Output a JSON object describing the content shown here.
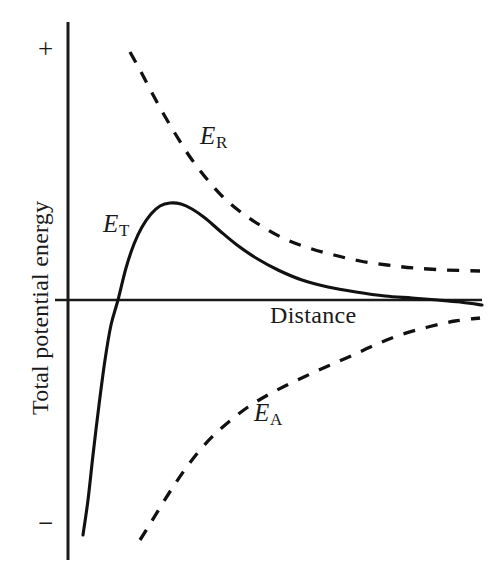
{
  "figure": {
    "background_color": "#ffffff",
    "ink_color": "#1a1a1a",
    "width": 500,
    "height": 573
  },
  "axes": {
    "y_axis_label": "Total potential energy",
    "x_axis_label": "Distance",
    "y_tick_positive": "+",
    "y_tick_negative": "−",
    "y_axis_x_px": 68,
    "zero_line_y_px": 300
  },
  "labels": {
    "e_total_symbol": "E",
    "e_total_subscript": "T",
    "e_repulsive_symbol": "E",
    "e_repulsive_subscript": "R",
    "e_attractive_symbol": "E",
    "e_attractive_subscript": "A"
  },
  "chart_data": {
    "type": "line",
    "title": "",
    "xlabel": "Distance",
    "ylabel": "Total potential energy",
    "xlim": [
      0,
      100
    ],
    "ylim": [
      -100,
      100
    ],
    "grid": false,
    "legend": "inline-annotations",
    "axis_tick_labels": {
      "y": [
        "+",
        "−"
      ],
      "x": []
    },
    "annotations": [
      {
        "text": "E_R",
        "x_px": 210,
        "y_px": 138,
        "series": "repulsive"
      },
      {
        "text": "E_T",
        "x_px": 113,
        "y_px": 223,
        "series": "total"
      },
      {
        "text": "E_A",
        "x_px": 264,
        "y_px": 412,
        "series": "attractive"
      },
      {
        "text": "Distance",
        "x_px": 315,
        "y_px": 315,
        "series": "axis"
      }
    ],
    "series": [
      {
        "name": "E_T",
        "label": "Total potential energy curve",
        "style": "solid",
        "description": "Sum of repulsive and attractive energies: steep negative primary minimum at very short distance, rises steeply through zero, peaks at an energy barrier, then decays and crosses below zero into a shallow secondary minimum.",
        "points_px": [
          [
            83,
            535
          ],
          [
            88,
            500
          ],
          [
            93,
            455
          ],
          [
            99,
            405
          ],
          [
            105,
            360
          ],
          [
            111,
            325
          ],
          [
            118,
            300
          ],
          [
            126,
            268
          ],
          [
            134,
            244
          ],
          [
            142,
            227
          ],
          [
            151,
            214
          ],
          [
            160,
            206
          ],
          [
            170,
            203
          ],
          [
            181,
            204
          ],
          [
            192,
            209
          ],
          [
            205,
            218
          ],
          [
            220,
            231
          ],
          [
            237,
            245
          ],
          [
            256,
            258
          ],
          [
            278,
            270
          ],
          [
            302,
            280
          ],
          [
            328,
            287
          ],
          [
            356,
            292
          ],
          [
            385,
            296
          ],
          [
            412,
            298
          ],
          [
            438,
            300
          ],
          [
            460,
            302
          ],
          [
            482,
            305
          ]
        ]
      },
      {
        "name": "E_R",
        "label": "Electrostatic repulsion energy",
        "style": "dashed",
        "description": "Positive, decays exponentially with distance toward zero.",
        "points_px": [
          [
            130,
            52
          ],
          [
            140,
            70
          ],
          [
            151,
            91
          ],
          [
            163,
            113
          ],
          [
            176,
            135
          ],
          [
            190,
            157
          ],
          [
            206,
            178
          ],
          [
            223,
            197
          ],
          [
            242,
            213
          ],
          [
            263,
            227
          ],
          [
            285,
            239
          ],
          [
            309,
            248
          ],
          [
            334,
            255
          ],
          [
            360,
            261
          ],
          [
            387,
            265
          ],
          [
            414,
            268
          ],
          [
            446,
            270
          ],
          [
            480,
            271
          ]
        ]
      },
      {
        "name": "E_A",
        "label": "Van der Waals attraction energy",
        "style": "dashed",
        "description": "Negative, rises toward zero as distance increases.",
        "points_px": [
          [
            140,
            540
          ],
          [
            150,
            524
          ],
          [
            161,
            506
          ],
          [
            173,
            487
          ],
          [
            186,
            468
          ],
          [
            200,
            450
          ],
          [
            215,
            434
          ],
          [
            231,
            420
          ],
          [
            248,
            407
          ],
          [
            266,
            396
          ],
          [
            285,
            386
          ],
          [
            306,
            376
          ],
          [
            328,
            366
          ],
          [
            351,
            356
          ],
          [
            375,
            345
          ],
          [
            400,
            335
          ],
          [
            428,
            327
          ],
          [
            455,
            321
          ],
          [
            480,
            318
          ]
        ]
      }
    ]
  }
}
